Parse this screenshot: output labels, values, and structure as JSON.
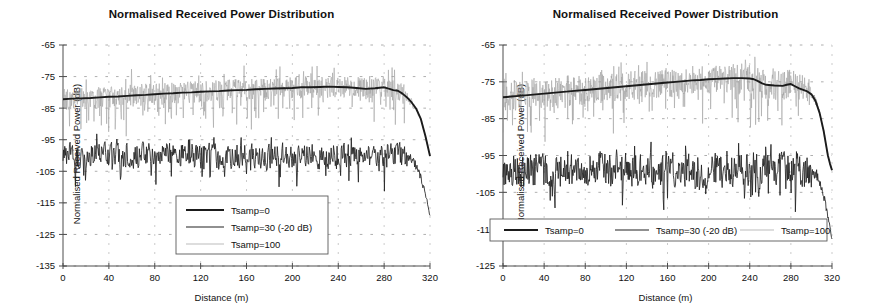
{
  "figure": {
    "background": "#ffffff",
    "panel_count": 2
  },
  "colors": {
    "tsamp0": "#1b1b1b",
    "tsamp30": "#222222",
    "tsamp100": "#9e9e9e",
    "axis": "#4d4d4d",
    "grid": "#9a9a9a",
    "text": "#111111"
  },
  "chart_data": [
    {
      "panel": "left",
      "type": "line",
      "title": "Normalised Received Power Distribution",
      "xlabel": "Distance (m)",
      "ylabel": "Normalised Received Power (dB)",
      "xlim": [
        0,
        320
      ],
      "ylim": [
        -135,
        -65
      ],
      "xticks": [
        0,
        40,
        80,
        120,
        160,
        200,
        240,
        280,
        320
      ],
      "yticks": [
        -135,
        -125,
        -115,
        -105,
        -95,
        -85,
        -75,
        -65
      ],
      "xticklabels": [
        "0",
        "40",
        "80",
        "120",
        "160",
        "200",
        "240",
        "280",
        "320"
      ],
      "yticklabels": [
        "-135",
        "-125",
        "-115",
        "-105",
        "-95",
        "-85",
        "-75",
        "-65"
      ],
      "grid": "horizontal dotted gridlines at each y tick; faint vertical dotted gridlines at x ticks",
      "legend": {
        "position": "inside plot, lower centre",
        "orientation": "vertical",
        "entries": [
          {
            "label": "Tsamp=0",
            "color": "#1b1b1b",
            "width": 2.2
          },
          {
            "label": "Tsamp=30 (-20 dB)",
            "color": "#222222",
            "width": 1.1
          },
          {
            "label": "Tsamp=100",
            "color": "#9e9e9e",
            "width": 0.7
          }
        ]
      },
      "series": [
        {
          "name": "Tsamp=0",
          "description": "Smooth thick trend line rising gently from about -82 dB at 0 m to about -78 dB near 280 m, then falling steeply after 300 m to about -100 dB at 320 m",
          "x": [
            0,
            8,
            16,
            24,
            32,
            40,
            48,
            56,
            64,
            72,
            80,
            88,
            96,
            104,
            112,
            120,
            128,
            136,
            144,
            152,
            160,
            168,
            176,
            184,
            192,
            200,
            208,
            216,
            224,
            232,
            240,
            248,
            256,
            264,
            272,
            280,
            284,
            288,
            292,
            296,
            300,
            304,
            308,
            312,
            316,
            318,
            320
          ],
          "y": [
            -82.2,
            -82.0,
            -81.9,
            -81.8,
            -81.6,
            -81.4,
            -81.3,
            -81.1,
            -80.9,
            -80.8,
            -80.6,
            -80.4,
            -80.3,
            -80.1,
            -80.0,
            -79.8,
            -79.7,
            -79.6,
            -79.4,
            -79.3,
            -79.2,
            -79.0,
            -78.9,
            -78.8,
            -78.7,
            -78.6,
            -78.4,
            -78.4,
            -78.3,
            -78.2,
            -78.3,
            -78.4,
            -78.6,
            -78.9,
            -78.7,
            -78.4,
            -78.8,
            -79.3,
            -79.5,
            -80.4,
            -81.6,
            -83.2,
            -85.2,
            -88.4,
            -93.8,
            -97.0,
            -100.2
          ]
        },
        {
          "name": "Tsamp=30 (-20 dB)",
          "description": "Noisy dark trace oscillating about -100 dB across the whole span, tightening near -98 dB mid range, then dropping after 300 m to about -119 dB at 320 m",
          "mean_level": -100,
          "noise_amplitude": 6,
          "tail_drop_start_m": 300,
          "tail_end_value": -119
        },
        {
          "name": "Tsamp=100",
          "description": "Light grey high-variance noise riding on the Tsamp=0 trend, spiking up to about -73 dB and down to about -90 dB, collapsing after 300 m",
          "mean_offset_from_trend": 0,
          "noise_amplitude": 7,
          "tail_drop_start_m": 300,
          "tail_end_value": -99
        }
      ]
    },
    {
      "panel": "right",
      "type": "line",
      "title": "Normalised Received Power Distribution",
      "xlabel": "Distance (m)",
      "ylabel": "Normalised Received Power (dB)",
      "xlim": [
        0,
        320
      ],
      "ylim": [
        -125,
        -65
      ],
      "xticks": [
        0,
        40,
        80,
        120,
        160,
        200,
        240,
        280,
        320
      ],
      "yticks": [
        -125,
        -115,
        -105,
        -95,
        -85,
        -75,
        -65
      ],
      "xticklabels": [
        "0",
        "40",
        "80",
        "120",
        "160",
        "200",
        "240",
        "280",
        "320"
      ],
      "yticklabels": [
        "-125",
        "-115",
        "-105",
        "-95",
        "-85",
        "-75",
        "-65"
      ],
      "grid": "horizontal dotted gridlines at each y tick; faint vertical dotted gridlines at x ticks",
      "legend": {
        "position": "inside plot, bottom, full width",
        "orientation": "horizontal",
        "entries": [
          {
            "label": "Tsamp=0",
            "color": "#1b1b1b",
            "width": 2.2
          },
          {
            "label": "Tsamp=30 (-20 dB)",
            "color": "#222222",
            "width": 1.1
          },
          {
            "label": "Tsamp=100",
            "color": "#9e9e9e",
            "width": 0.7
          }
        ]
      },
      "series": [
        {
          "name": "Tsamp=0",
          "description": "Smooth thick trend rising from about -79 dB at 0 m to a plateau near -74 dB between 210 and 250 m, a small step down after 250 m, then a steep fall after 295 m to about -99 dB at 320 m",
          "x": [
            0,
            8,
            16,
            24,
            32,
            40,
            48,
            56,
            64,
            72,
            80,
            88,
            96,
            104,
            112,
            120,
            128,
            136,
            144,
            152,
            160,
            168,
            176,
            184,
            192,
            200,
            208,
            216,
            224,
            232,
            240,
            244,
            248,
            252,
            256,
            264,
            272,
            276,
            280,
            284,
            288,
            292,
            296,
            300,
            304,
            308,
            312,
            316,
            318,
            320
          ],
          "y": [
            -79.2,
            -79.0,
            -78.8,
            -78.6,
            -78.4,
            -78.2,
            -78.0,
            -77.8,
            -77.6,
            -77.4,
            -77.2,
            -77.0,
            -76.8,
            -76.6,
            -76.4,
            -76.2,
            -76.0,
            -75.8,
            -75.6,
            -75.4,
            -75.2,
            -75.0,
            -74.8,
            -74.6,
            -74.5,
            -74.3,
            -74.2,
            -74.1,
            -74.0,
            -74.0,
            -74.1,
            -74.3,
            -74.8,
            -75.4,
            -75.8,
            -76.0,
            -76.1,
            -75.8,
            -75.6,
            -76.2,
            -76.8,
            -77.2,
            -77.6,
            -78.4,
            -80.2,
            -83.5,
            -88.5,
            -95.0,
            -97.2,
            -99.0
          ]
        },
        {
          "name": "Tsamp=30 (-20 dB)",
          "description": "Noisy dark trace oscillating about -99 dB with excursions between -92 and -110 dB, dropping after 300 m to about -118 dB at 320 m",
          "mean_level": -99,
          "noise_amplitude": 7,
          "tail_drop_start_m": 300,
          "tail_end_value": -118
        },
        {
          "name": "Tsamp=100",
          "description": "Light grey high-variance noise around the Tsamp=0 trend with deep downward spikes reaching about -88 dB and upward spikes to about -70 dB, collapsing after 300 m",
          "mean_offset_from_trend": 0,
          "noise_amplitude": 8,
          "tail_drop_start_m": 300,
          "tail_end_value": -98
        }
      ]
    }
  ]
}
